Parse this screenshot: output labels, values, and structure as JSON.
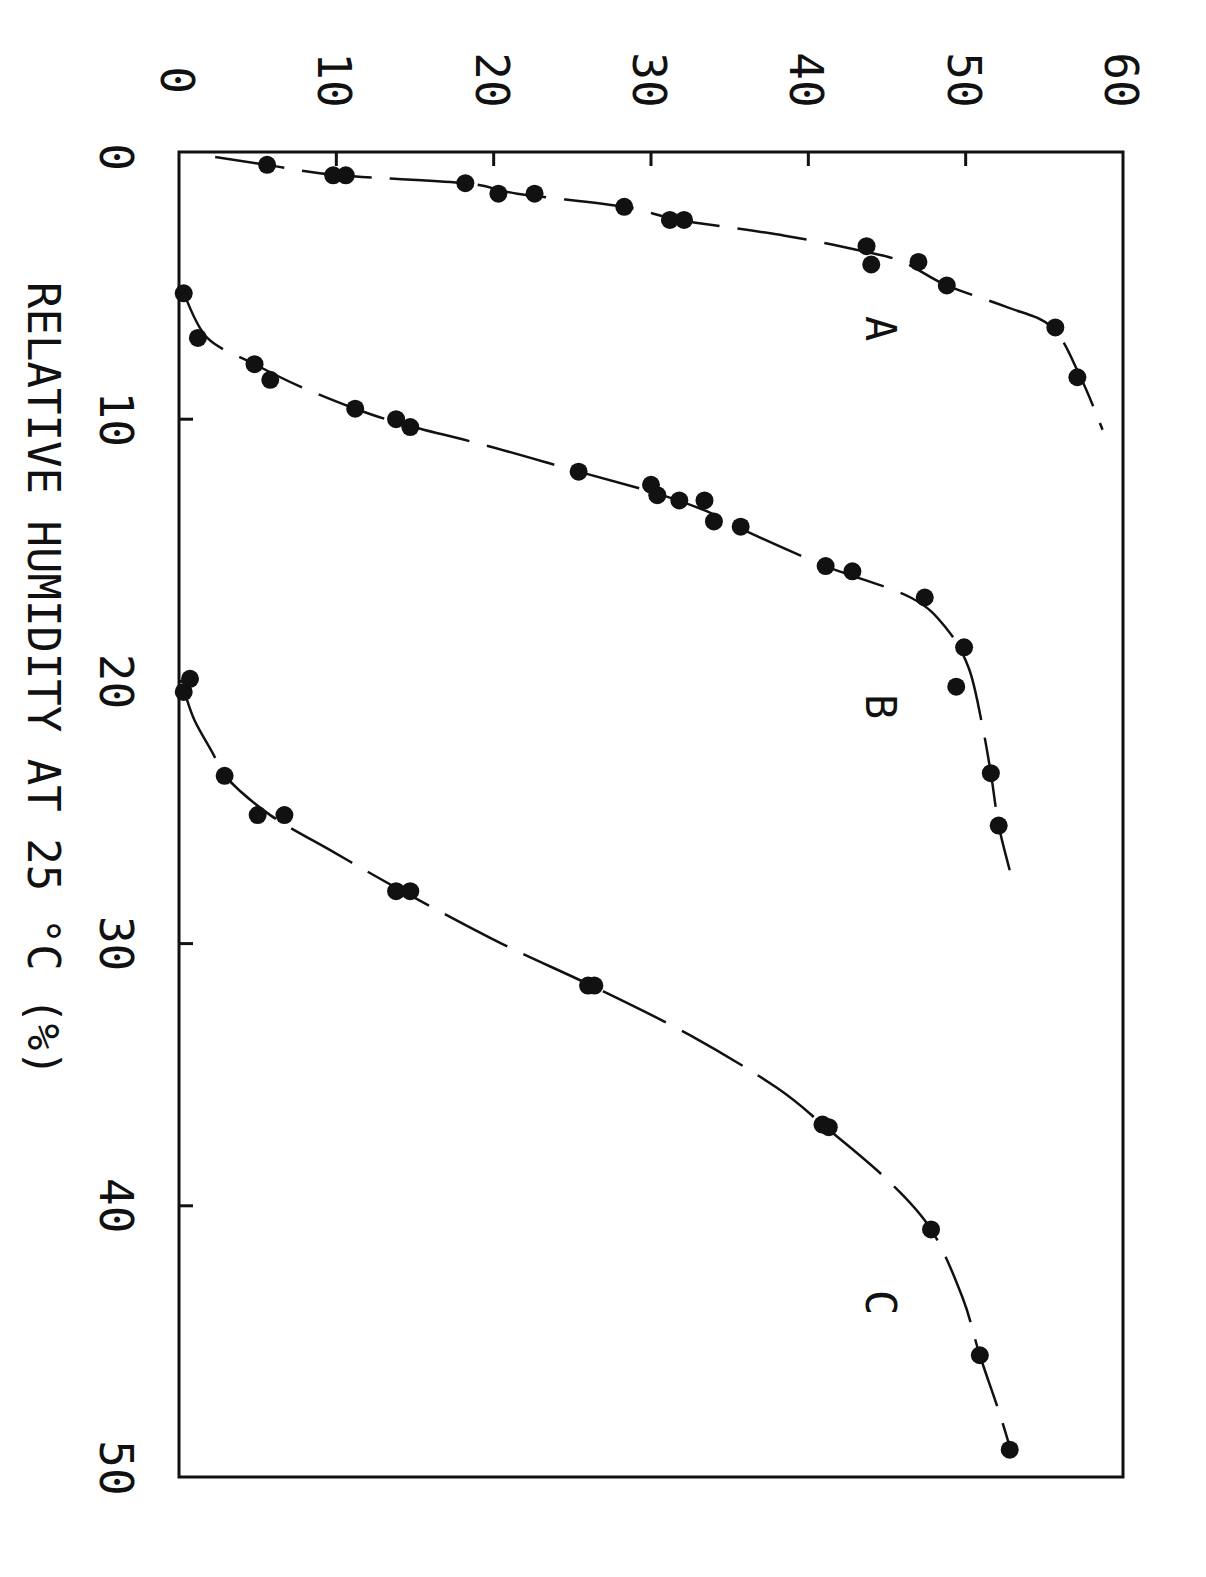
{
  "chart_data": {
    "type": "scatter",
    "orientation_note": "Figure is rotated 90 degrees clockwise; relative humidity runs top-to-bottom, value axis runs left-to-right along the top.",
    "title": "",
    "xlabel": "RELATIVE HUMIDITY AT 25 °C (%)",
    "ylabel": "",
    "xlim": [
      0,
      50
    ],
    "ylim": [
      0,
      60
    ],
    "x_ticks": [
      "0",
      "10",
      "20",
      "30",
      "40",
      "50"
    ],
    "y_ticks": [
      "0",
      "10",
      "20",
      "30",
      "40",
      "50",
      "60"
    ],
    "grid": false,
    "legend": "none (curves labeled inline A, B, C)",
    "series": [
      {
        "name": "A",
        "marker": "filled circle",
        "line": "dashed fitted curve",
        "points": [
          {
            "x": 0.3,
            "y": 5.6
          },
          {
            "x": 0.7,
            "y": 9.8
          },
          {
            "x": 0.7,
            "y": 10.6
          },
          {
            "x": 1.0,
            "y": 18.2
          },
          {
            "x": 1.4,
            "y": 20.3
          },
          {
            "x": 1.4,
            "y": 22.6
          },
          {
            "x": 1.9,
            "y": 28.3
          },
          {
            "x": 2.4,
            "y": 31.2
          },
          {
            "x": 2.4,
            "y": 32.1
          },
          {
            "x": 3.4,
            "y": 43.7
          },
          {
            "x": 4.1,
            "y": 44.0
          },
          {
            "x": 4.0,
            "y": 47.0
          },
          {
            "x": 4.9,
            "y": 48.8
          },
          {
            "x": 6.5,
            "y": 55.7
          },
          {
            "x": 8.4,
            "y": 57.1
          }
        ],
        "curve": [
          [
            0.0,
            2.3
          ],
          [
            0.3,
            5.6
          ],
          [
            0.7,
            10.2
          ],
          [
            1.0,
            18.2
          ],
          [
            1.4,
            21.5
          ],
          [
            1.9,
            28.3
          ],
          [
            2.4,
            31.8
          ],
          [
            3.0,
            38.5
          ],
          [
            3.6,
            43.5
          ],
          [
            4.0,
            46.0
          ],
          [
            4.9,
            48.8
          ],
          [
            5.7,
            52.5
          ],
          [
            6.5,
            55.5
          ],
          [
            8.4,
            57.3
          ],
          [
            10.4,
            58.7
          ]
        ]
      },
      {
        "name": "B",
        "marker": "filled circle",
        "line": "dashed fitted curve",
        "points": [
          {
            "x": 5.2,
            "y": 0.3
          },
          {
            "x": 6.9,
            "y": 1.2
          },
          {
            "x": 7.9,
            "y": 4.8
          },
          {
            "x": 8.5,
            "y": 5.8
          },
          {
            "x": 9.6,
            "y": 11.2
          },
          {
            "x": 10.0,
            "y": 13.8
          },
          {
            "x": 10.3,
            "y": 14.7
          },
          {
            "x": 12.0,
            "y": 25.4
          },
          {
            "x": 12.5,
            "y": 30.0
          },
          {
            "x": 12.9,
            "y": 30.4
          },
          {
            "x": 13.1,
            "y": 31.8
          },
          {
            "x": 13.1,
            "y": 33.4
          },
          {
            "x": 13.9,
            "y": 34.0
          },
          {
            "x": 14.1,
            "y": 35.7
          },
          {
            "x": 15.6,
            "y": 41.1
          },
          {
            "x": 15.8,
            "y": 42.8
          },
          {
            "x": 16.8,
            "y": 47.4
          },
          {
            "x": 18.7,
            "y": 49.9
          },
          {
            "x": 20.2,
            "y": 49.4
          },
          {
            "x": 23.5,
            "y": 51.6
          },
          {
            "x": 25.5,
            "y": 52.1
          }
        ],
        "curve": [
          [
            5.2,
            0.3
          ],
          [
            6.9,
            1.8
          ],
          [
            7.9,
            4.8
          ],
          [
            8.7,
            7.5
          ],
          [
            9.6,
            11.2
          ],
          [
            10.2,
            14.3
          ],
          [
            11.0,
            19.5
          ],
          [
            12.0,
            25.4
          ],
          [
            12.8,
            30.2
          ],
          [
            13.5,
            33.5
          ],
          [
            14.2,
            35.8
          ],
          [
            15.6,
            41.1
          ],
          [
            16.8,
            46.5
          ],
          [
            18.0,
            48.8
          ],
          [
            19.5,
            50.2
          ],
          [
            21.5,
            51.0
          ],
          [
            23.5,
            51.6
          ],
          [
            25.5,
            52.1
          ],
          [
            27.2,
            52.8
          ]
        ]
      },
      {
        "name": "C",
        "marker": "filled circle",
        "line": "dashed fitted curve",
        "points": [
          {
            "x": 19.9,
            "y": 0.7
          },
          {
            "x": 20.4,
            "y": 0.3
          },
          {
            "x": 23.6,
            "y": 2.9
          },
          {
            "x": 25.1,
            "y": 5.0
          },
          {
            "x": 25.1,
            "y": 6.7
          },
          {
            "x": 28.0,
            "y": 13.8
          },
          {
            "x": 28.0,
            "y": 14.7
          },
          {
            "x": 31.6,
            "y": 26.0
          },
          {
            "x": 31.6,
            "y": 26.4
          },
          {
            "x": 36.9,
            "y": 40.9
          },
          {
            "x": 37.0,
            "y": 41.3
          },
          {
            "x": 40.9,
            "y": 47.8
          },
          {
            "x": 45.7,
            "y": 50.9
          },
          {
            "x": 49.3,
            "y": 52.8
          }
        ],
        "curve": [
          [
            20.5,
            0.4
          ],
          [
            21.5,
            1.0
          ],
          [
            22.8,
            2.2
          ],
          [
            23.6,
            2.9
          ],
          [
            25.1,
            5.8
          ],
          [
            26.5,
            9.8
          ],
          [
            28.0,
            14.2
          ],
          [
            30.0,
            20.5
          ],
          [
            31.6,
            26.2
          ],
          [
            33.5,
            32.5
          ],
          [
            35.5,
            38.0
          ],
          [
            37.0,
            41.1
          ],
          [
            39.0,
            45.0
          ],
          [
            40.9,
            47.8
          ],
          [
            43.5,
            49.8
          ],
          [
            45.7,
            50.9
          ],
          [
            48.0,
            52.2
          ],
          [
            49.6,
            53.0
          ]
        ]
      }
    ],
    "annotations": [
      {
        "text": "A",
        "x": 5.5,
        "y": 45.3
      },
      {
        "text": "B",
        "x": 20.8,
        "y": 45.3
      },
      {
        "text": "C",
        "x": 42.6,
        "y": 45.3
      }
    ]
  },
  "axes": {
    "rh_axis_title": "RELATIVE HUMIDITY AT 25 °C (%)",
    "rh_ticks": [
      "0",
      "10",
      "20",
      "30",
      "40",
      "50"
    ],
    "value_ticks": [
      "0",
      "10",
      "20",
      "30",
      "40",
      "50",
      "60"
    ]
  },
  "labels": {
    "A": "A",
    "B": "B",
    "C": "C"
  }
}
